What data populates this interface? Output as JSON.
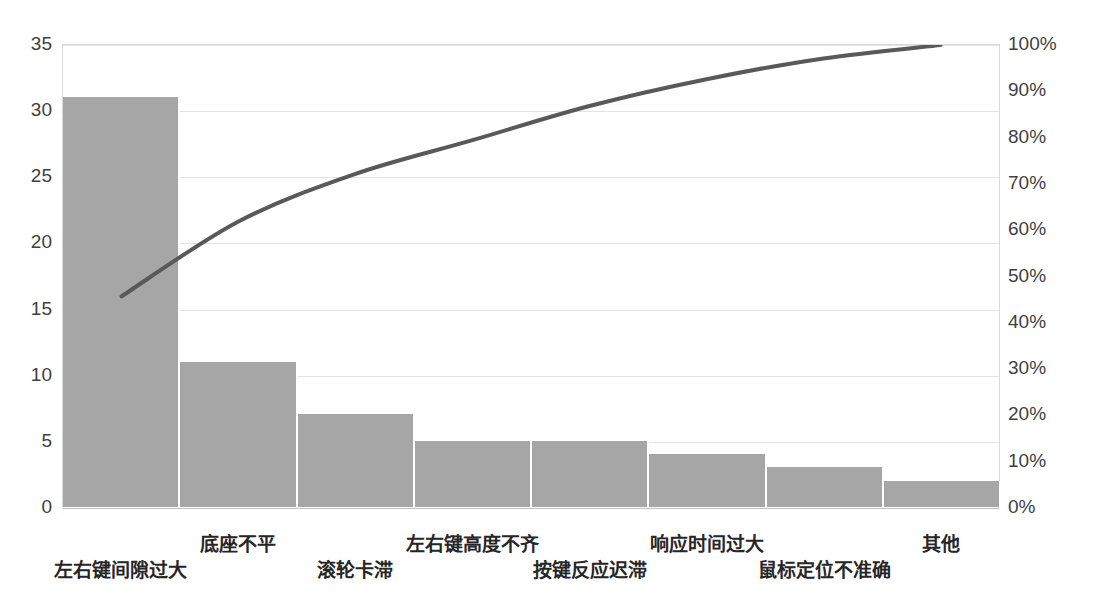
{
  "chart_data": {
    "type": "bar",
    "title": "",
    "subtitle": "",
    "xlabel": "",
    "ylabel": "",
    "categories": [
      "左右键间隙过大",
      "底座不平",
      "滚轮卡滞",
      "左右键高度不齐",
      "按键反应迟滞",
      "响应时间过大",
      "鼠标定位不准确",
      "其他"
    ],
    "series": [
      {
        "name": "频数",
        "type": "bar",
        "axis": "left",
        "values": [
          31,
          11,
          7,
          5,
          5,
          4,
          3,
          2
        ]
      },
      {
        "name": "累计百分比",
        "type": "line",
        "axis": "right",
        "values": [
          45.6,
          61.8,
          72.1,
          79.4,
          86.8,
          92.6,
          97.1,
          100.0
        ]
      }
    ],
    "total": 68,
    "ylim": [
      0,
      35
    ],
    "y2lim": [
      0,
      100
    ],
    "yticks": [
      "0",
      "5",
      "10",
      "15",
      "20",
      "25",
      "30",
      "35"
    ],
    "ytick_values": [
      0,
      5,
      10,
      15,
      20,
      25,
      30,
      35
    ],
    "y2ticks": [
      "0%",
      "10%",
      "20%",
      "30%",
      "40%",
      "50%",
      "60%",
      "70%",
      "80%",
      "90%",
      "100%"
    ],
    "y2tick_values": [
      0,
      10,
      20,
      30,
      40,
      50,
      60,
      70,
      80,
      90,
      100
    ],
    "grid": true,
    "legend": "none",
    "colors": {
      "bar": "#a6a6a6",
      "line": "#595959",
      "grid": "#e3e3e3",
      "axis_text": "#3f3f3f",
      "category_text": "#262626",
      "background": "#ffffff"
    }
  }
}
